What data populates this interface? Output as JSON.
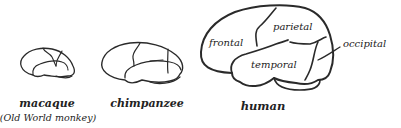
{
  "figure": {
    "brains": [
      {
        "name": "macaque",
        "label": "macaque",
        "sublabel": "(Old World monkey)"
      },
      {
        "name": "chimpanzee",
        "label": "chimpanzee"
      },
      {
        "name": "human",
        "label": "human",
        "regions": [
          "frontal",
          "parietal",
          "temporal",
          "occipital"
        ]
      }
    ]
  }
}
